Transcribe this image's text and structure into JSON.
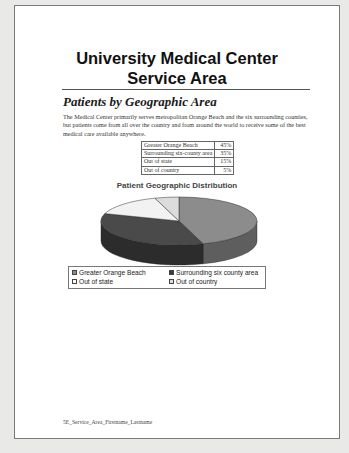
{
  "document": {
    "title_line1": "University Medical Center",
    "title_line2": "Service Area",
    "subheading": "Patients by Geographic Area",
    "paragraph": "The Medical Center primarily serves metropolitan Orange Beach and the six surrounding counties, but patients come from all over the country and from around the world to receive some of the best medical care available anywhere.",
    "table": {
      "rows": [
        {
          "label": "Greater Orange Beach",
          "value": "45%"
        },
        {
          "label": "Surrounding six-county area",
          "value": "35%"
        },
        {
          "label": "Out of state",
          "value": "15%"
        },
        {
          "label": "Out of country",
          "value": "5%"
        }
      ]
    },
    "footer": "5E_Service_Area_Firstname_Lastname"
  },
  "chart_data": {
    "type": "pie",
    "title": "Patient Geographic Distribution",
    "categories": [
      "Greater Orange Beach",
      "Surrounding six county area",
      "Out of state",
      "Out of country"
    ],
    "values": [
      45,
      35,
      15,
      5
    ],
    "colors": [
      "#8c8c8c",
      "#4a4a4a",
      "#f2f2f2",
      "#dcdcdc"
    ],
    "style": "3d",
    "legend": {
      "position": "bottom",
      "entries": [
        "Greater Orange Beach",
        "Surrounding six county area",
        "Out of state",
        "Out of country"
      ]
    }
  }
}
